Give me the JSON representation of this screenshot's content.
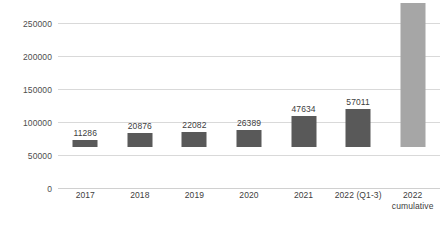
{
  "chart_data": {
    "type": "bar",
    "title": "",
    "subtitle": "",
    "xlabel": "",
    "ylabel": "",
    "categories": [
      "2017",
      "2018",
      "2019",
      "2020",
      "2021",
      "2022 (Q1-3)",
      "2022 cumulative"
    ],
    "category_lines": [
      [
        "2017"
      ],
      [
        "2018"
      ],
      [
        "2019"
      ],
      [
        "2020"
      ],
      [
        "2021"
      ],
      [
        "2022 (Q1-3)"
      ],
      [
        "2022",
        "cumulative"
      ]
    ],
    "values": [
      11286,
      20876,
      22082,
      26389,
      47634,
      57011,
      218424
    ],
    "data_labels": [
      "11286",
      "20876",
      "22082",
      "26389",
      "47634",
      "57011",
      "218424"
    ],
    "ylim": [
      0,
      250000
    ],
    "yticks": [
      0,
      50000,
      100000,
      150000,
      200000,
      250000
    ],
    "ytick_labels": [
      "0",
      "50000",
      "100000",
      "150000",
      "200000",
      "250000"
    ],
    "grid": true,
    "legend": false,
    "legend_position": "none",
    "bar_colors": [
      "#595959",
      "#595959",
      "#595959",
      "#595959",
      "#595959",
      "#595959",
      "#a6a6a6"
    ],
    "colors": {
      "bar_primary": "#595959",
      "bar_highlight": "#a6a6a6",
      "gridline": "#d9d9d9",
      "label_text": "#404040",
      "tick_text": "#4d4d4d",
      "background": "#ffffff"
    }
  }
}
